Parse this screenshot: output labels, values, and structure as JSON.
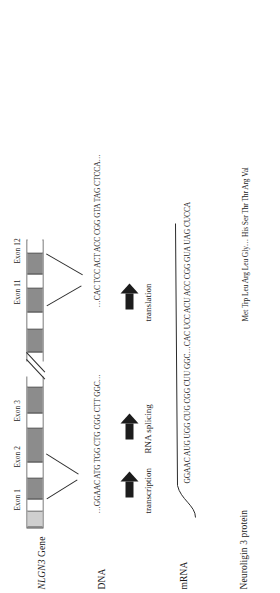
{
  "figure": {
    "orientation": "rotated-90-ccw"
  },
  "rows": {
    "gene_label_italic": "NLGN3",
    "gene_label_rest": " Gene",
    "dna_label": "DNA",
    "mrna_label": "mRNA",
    "protein_label": "Neuroligin 3 protein"
  },
  "exon_labels": [
    {
      "text": "Exon 1"
    },
    {
      "text": "Exon 2"
    },
    {
      "text": "Exon 3"
    },
    {
      "text": "Exon 11"
    },
    {
      "text": "Exon 12"
    }
  ],
  "gene_bar": {
    "segments": [
      {
        "type": "exonlight",
        "left": 0,
        "width": 17
      },
      {
        "type": "intron",
        "left": 17,
        "width": 11
      },
      {
        "type": "exon",
        "left": 28,
        "width": 22
      },
      {
        "type": "intron",
        "left": 50,
        "width": 15
      },
      {
        "type": "exon",
        "left": 65,
        "width": 35
      },
      {
        "type": "intron",
        "left": 100,
        "width": 14
      },
      {
        "type": "exon",
        "left": 114,
        "width": 27
      },
      {
        "type": "intron",
        "left": 141,
        "width": 18
      },
      {
        "type": "exon",
        "left": 175,
        "width": 24
      },
      {
        "type": "intron",
        "left": 199,
        "width": 16
      },
      {
        "type": "exon",
        "left": 215,
        "width": 25
      },
      {
        "type": "intron",
        "left": 240,
        "width": 13
      },
      {
        "type": "exon",
        "left": 253,
        "width": 22
      },
      {
        "type": "intron",
        "left": 275,
        "width": 14
      }
    ],
    "break_position": 159,
    "total_width": 289
  },
  "sequences": {
    "dna_5prime": "…GGAAC ATG TGG CTG CGG CTT GGC…",
    "dna_5prime_underline": "ATG",
    "dna_3prime": "…CAC TCC ACT ACC CGG GTA TAG CTCCA…",
    "dna_3prime_underline": "TAG",
    "mrna": "GGAAC AUG UGG CUG CGG CUU GGC…CAC UCC ACU ACC CGG GUA UAG CUCCA",
    "protein": "Met Trp Leu Arg Leu Gly… His Ser Thr Thr Arg Val"
  },
  "steps": [
    {
      "label": "transcription",
      "icon": "right-arrow-icon"
    },
    {
      "label": "RNA splicing",
      "icon": "right-arrow-icon"
    },
    {
      "label": "translation",
      "icon": "right-arrow-icon"
    }
  ],
  "colors": {
    "exon_fill": "#8c8c8c",
    "exon_light_fill": "#cfcfcf",
    "intron_fill": "#ffffff",
    "stroke": "#4d4d4d",
    "arrow_fill": "#1c1c1c",
    "text": "#1a1a1a",
    "background": "#ffffff"
  }
}
